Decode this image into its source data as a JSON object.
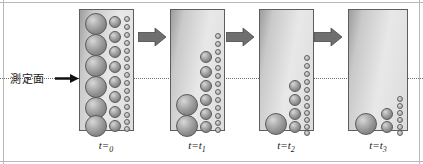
{
  "figure": {
    "measurement": {
      "label": "測定面",
      "arrow_icon": "right-arrow-icon",
      "line_style": "dotted",
      "line_color": "#6b6b6b",
      "line_y": 78
    },
    "colors": {
      "container_border": "#5d5d5d",
      "container_fill_light": "#e8e8e8",
      "container_fill_dark": "#9d9d9d",
      "sphere_fill": "#a8a8a8",
      "sphere_border": "#5a5a5a",
      "arrow_fill": "#6f6f6f",
      "frame_line": "#b9b9b9"
    },
    "step_arrows": [
      {
        "name": "step-arrow-1",
        "icon": "block-right-arrow-icon"
      },
      {
        "name": "step-arrow-2",
        "icon": "block-right-arrow-icon"
      },
      {
        "name": "step-arrow-3",
        "icon": "block-right-arrow-icon"
      }
    ],
    "columns": [
      {
        "id": "t0",
        "label": "t=0",
        "label_base": "t=",
        "label_sub": "0",
        "large_count": 6,
        "medium_count": 8,
        "small_count": 15,
        "large": [
          {
            "cx": 16,
            "cy": 14,
            "r": 11
          },
          {
            "cx": 16,
            "cy": 35,
            "r": 11
          },
          {
            "cx": 16,
            "cy": 56,
            "r": 11
          },
          {
            "cx": 16,
            "cy": 77,
            "r": 11
          },
          {
            "cx": 16,
            "cy": 98,
            "r": 11
          },
          {
            "cx": 16,
            "cy": 116,
            "r": 11
          }
        ],
        "medium": [
          {
            "cx": 35,
            "cy": 12,
            "r": 6
          },
          {
            "cx": 35,
            "cy": 27,
            "r": 6
          },
          {
            "cx": 35,
            "cy": 42,
            "r": 6
          },
          {
            "cx": 35,
            "cy": 57,
            "r": 6
          },
          {
            "cx": 35,
            "cy": 72,
            "r": 6
          },
          {
            "cx": 35,
            "cy": 87,
            "r": 6
          },
          {
            "cx": 35,
            "cy": 102,
            "r": 6
          },
          {
            "cx": 35,
            "cy": 116,
            "r": 6
          }
        ],
        "small": [
          {
            "cx": 47,
            "cy": 9,
            "r": 3.2
          },
          {
            "cx": 47,
            "cy": 17,
            "r": 3.2
          },
          {
            "cx": 47,
            "cy": 25,
            "r": 3.2
          },
          {
            "cx": 47,
            "cy": 33,
            "r": 3.2
          },
          {
            "cx": 47,
            "cy": 41,
            "r": 3.2
          },
          {
            "cx": 47,
            "cy": 49,
            "r": 3.2
          },
          {
            "cx": 47,
            "cy": 57,
            "r": 3.2
          },
          {
            "cx": 47,
            "cy": 65,
            "r": 3.2
          },
          {
            "cx": 47,
            "cy": 73,
            "r": 3.2
          },
          {
            "cx": 47,
            "cy": 81,
            "r": 3.2
          },
          {
            "cx": 47,
            "cy": 89,
            "r": 3.2
          },
          {
            "cx": 47,
            "cy": 97,
            "r": 3.2
          },
          {
            "cx": 47,
            "cy": 105,
            "r": 3.2
          },
          {
            "cx": 47,
            "cy": 112,
            "r": 3.2
          },
          {
            "cx": 47,
            "cy": 119,
            "r": 3.2
          }
        ]
      },
      {
        "id": "t1",
        "label": "t=t1",
        "label_base": "t=t",
        "label_sub": "1",
        "large_count": 2,
        "medium_count": 6,
        "small_count": 13,
        "large": [
          {
            "cx": 16,
            "cy": 95,
            "r": 11
          },
          {
            "cx": 16,
            "cy": 116,
            "r": 11
          }
        ],
        "medium": [
          {
            "cx": 35,
            "cy": 47,
            "r": 6
          },
          {
            "cx": 35,
            "cy": 62,
            "r": 6
          },
          {
            "cx": 35,
            "cy": 76,
            "r": 6
          },
          {
            "cx": 35,
            "cy": 90,
            "r": 6
          },
          {
            "cx": 35,
            "cy": 104,
            "r": 6
          },
          {
            "cx": 35,
            "cy": 117,
            "r": 6
          }
        ],
        "small": [
          {
            "cx": 47,
            "cy": 26,
            "r": 3.2
          },
          {
            "cx": 47,
            "cy": 34,
            "r": 3.2
          },
          {
            "cx": 47,
            "cy": 42,
            "r": 3.2
          },
          {
            "cx": 47,
            "cy": 50,
            "r": 3.2
          },
          {
            "cx": 47,
            "cy": 58,
            "r": 3.2
          },
          {
            "cx": 47,
            "cy": 66,
            "r": 3.2
          },
          {
            "cx": 47,
            "cy": 74,
            "r": 3.2
          },
          {
            "cx": 47,
            "cy": 82,
            "r": 3.2
          },
          {
            "cx": 47,
            "cy": 90,
            "r": 3.2
          },
          {
            "cx": 47,
            "cy": 98,
            "r": 3.2
          },
          {
            "cx": 47,
            "cy": 106,
            "r": 3.2
          },
          {
            "cx": 47,
            "cy": 113,
            "r": 3.2
          },
          {
            "cx": 47,
            "cy": 120,
            "r": 3.2
          }
        ]
      },
      {
        "id": "t2",
        "label": "t=t2",
        "label_base": "t=t",
        "label_sub": "2",
        "large_count": 1,
        "medium_count": 4,
        "small_count": 11,
        "large": [
          {
            "cx": 16,
            "cy": 114,
            "r": 11
          }
        ],
        "medium": [
          {
            "cx": 35,
            "cy": 76,
            "r": 6
          },
          {
            "cx": 35,
            "cy": 90,
            "r": 6
          },
          {
            "cx": 35,
            "cy": 104,
            "r": 6
          },
          {
            "cx": 35,
            "cy": 117,
            "r": 6
          }
        ],
        "small": [
          {
            "cx": 47,
            "cy": 48,
            "r": 3.2
          },
          {
            "cx": 47,
            "cy": 56,
            "r": 3.2
          },
          {
            "cx": 47,
            "cy": 64,
            "r": 3.2
          },
          {
            "cx": 47,
            "cy": 72,
            "r": 3.2
          },
          {
            "cx": 47,
            "cy": 80,
            "r": 3.2
          },
          {
            "cx": 47,
            "cy": 88,
            "r": 3.2
          },
          {
            "cx": 47,
            "cy": 96,
            "r": 3.2
          },
          {
            "cx": 47,
            "cy": 103,
            "r": 3.2
          },
          {
            "cx": 47,
            "cy": 110,
            "r": 3.2
          },
          {
            "cx": 47,
            "cy": 117,
            "r": 3.2
          },
          {
            "cx": 47,
            "cy": 123,
            "r": 3.2
          }
        ]
      },
      {
        "id": "t3",
        "label": "t=t3",
        "label_base": "t=t",
        "label_sub": "3",
        "large_count": 1,
        "medium_count": 2,
        "small_count": 6,
        "large": [
          {
            "cx": 17,
            "cy": 114,
            "r": 11
          }
        ],
        "medium": [
          {
            "cx": 38,
            "cy": 104,
            "r": 6
          },
          {
            "cx": 38,
            "cy": 117,
            "r": 6
          }
        ],
        "small": [
          {
            "cx": 51,
            "cy": 89,
            "r": 3.2
          },
          {
            "cx": 51,
            "cy": 96,
            "r": 3.2
          },
          {
            "cx": 51,
            "cy": 103,
            "r": 3.2
          },
          {
            "cx": 51,
            "cy": 110,
            "r": 3.2
          },
          {
            "cx": 51,
            "cy": 117,
            "r": 3.2
          },
          {
            "cx": 51,
            "cy": 123,
            "r": 3.2
          }
        ]
      }
    ]
  }
}
